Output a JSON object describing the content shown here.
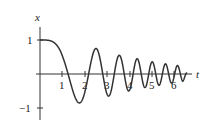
{
  "chart_data": {
    "type": "line",
    "title": "",
    "xlabel": "t",
    "ylabel": "x",
    "x_ticks": [
      "1",
      "2",
      "3",
      "4",
      "5",
      "6"
    ],
    "y_ticks": [
      "1",
      "−1"
    ],
    "xlim": [
      0,
      6.6
    ],
    "ylim": [
      -1.1,
      1.1
    ],
    "grid": false,
    "legend": null,
    "series": [
      {
        "name": "x(t)",
        "x": [
          0,
          0.5,
          1.0,
          1.25,
          1.77,
          2.17,
          2.51,
          2.8,
          3.07,
          3.31,
          3.54,
          3.76,
          3.96,
          4.15,
          4.34,
          4.52,
          4.69,
          4.86,
          5.01,
          5.17,
          5.32,
          5.46,
          5.6,
          5.74,
          5.87,
          6.0,
          6.13,
          6.25,
          6.37,
          6.5
        ],
        "y": [
          1.0,
          0.98,
          0.55,
          0.0,
          -0.85,
          0.0,
          0.75,
          0.0,
          -0.65,
          0.0,
          0.55,
          0.0,
          -0.5,
          0.0,
          0.45,
          0.0,
          -0.4,
          0.0,
          0.36,
          0.0,
          -0.33,
          0.0,
          0.3,
          0.0,
          -0.27,
          0.0,
          0.25,
          0.0,
          -0.22,
          0.1
        ]
      }
    ]
  },
  "axes": {
    "x_label": "t",
    "y_label": "x",
    "x_tick_labels": [
      "1",
      "2",
      "3",
      "4",
      "5",
      "6"
    ],
    "y_tick_labels": [
      "1",
      "−1"
    ]
  }
}
